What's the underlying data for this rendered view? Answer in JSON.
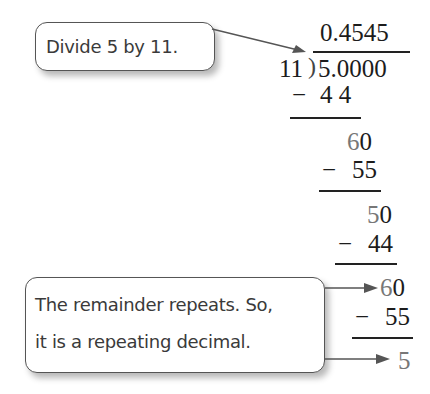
{
  "callouts": {
    "top": "Divide 5 by 11.",
    "bottom_line1": "The remainder repeats. So,",
    "bottom_line2": "it is a repeating decimal."
  },
  "division": {
    "quotient": "0.4545",
    "divisor": "11",
    "bracket": ")",
    "dividend": "5.0000",
    "steps": [
      {
        "minus": "−",
        "subtrahend": "4 4"
      },
      {
        "remainder_gray": "6",
        "remainder_black": "0"
      },
      {
        "minus": "−",
        "subtrahend": "55"
      },
      {
        "remainder_gray": "5",
        "remainder_black": "0"
      },
      {
        "minus": "−",
        "subtrahend": "44"
      },
      {
        "remainder_gray": "6",
        "remainder_black": "0"
      },
      {
        "minus": "−",
        "subtrahend": "55"
      },
      {
        "remainder_gray": "5"
      }
    ]
  },
  "colors": {
    "text": "#3a3a3a",
    "math": "#1c1c1c",
    "brought_down": "#777777",
    "arrow": "#555555"
  }
}
